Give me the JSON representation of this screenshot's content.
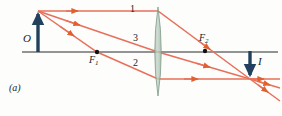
{
  "figure": {
    "caption": "(a)",
    "background_color": "#fdfdfc",
    "border_color": "#e0e0dc"
  },
  "optical_axis": {
    "name": "optical-axis",
    "color": "#6e7072",
    "x_start": 22,
    "x_end": 278,
    "y": 52,
    "stroke_width": 1.6
  },
  "lens": {
    "name": "converging-lens",
    "type": "biconvex",
    "center_x": 158,
    "top_y": 7,
    "bottom_y": 96,
    "half_width": 6.5,
    "fill_color": "#b9ccbf",
    "edge_color": "#7e9a88",
    "opacity": 0.75
  },
  "object": {
    "label": "O",
    "name": "object-arrow",
    "color": "#23415e",
    "x": 38,
    "base_y": 52,
    "tip_y": 11,
    "direction": "up",
    "height_px": 41
  },
  "image": {
    "label": "I",
    "name": "image-arrow",
    "color": "#23415e",
    "x": 250,
    "base_y": 51,
    "tip_y": 79,
    "direction": "down",
    "height_px": 28
  },
  "focal_points": [
    {
      "label": "F",
      "subscript": "1",
      "name": "focal-point-f1",
      "x": 97,
      "y": 52,
      "side": "object-side",
      "dot_color": "#111111",
      "dot_radius": 2.2
    },
    {
      "label": "F",
      "subscript": "2",
      "name": "focal-point-f2",
      "x": 205,
      "y": 51,
      "side": "image-side",
      "dot_color": "#111111",
      "dot_radius": 2.2
    }
  ],
  "rays": {
    "color": "#e8705a",
    "arrow_color": "#e0602f",
    "stroke_width": 1.5,
    "items": [
      {
        "label": "1",
        "name": "ray-1-parallel",
        "description": "parallel to axis, refracts through F2",
        "points": [
          [
            38,
            11
          ],
          [
            158,
            11
          ],
          [
            250,
            79
          ],
          [
            280,
            101
          ]
        ],
        "arrow_at": [
          [
            76,
            11
          ],
          [
            208,
            48
          ],
          [
            266,
            91
          ]
        ]
      },
      {
        "label": "3",
        "name": "ray-3-through-center",
        "description": "through lens center, undeviated",
        "points": [
          [
            38,
            11
          ],
          [
            158,
            52
          ],
          [
            250,
            79
          ],
          [
            280,
            88
          ]
        ],
        "arrow_at": [
          [
            78,
            25
          ],
          [
            206,
            67
          ],
          [
            268,
            85
          ]
        ]
      },
      {
        "label": "2",
        "name": "ray-2-through-f1",
        "description": "through F1, refracts parallel to axis",
        "points": [
          [
            38,
            11
          ],
          [
            97,
            52
          ],
          [
            158,
            79
          ],
          [
            280,
            79
          ]
        ],
        "arrow_at": [
          [
            72,
            35
          ],
          [
            196,
            79
          ],
          [
            262,
            79
          ]
        ]
      }
    ]
  }
}
